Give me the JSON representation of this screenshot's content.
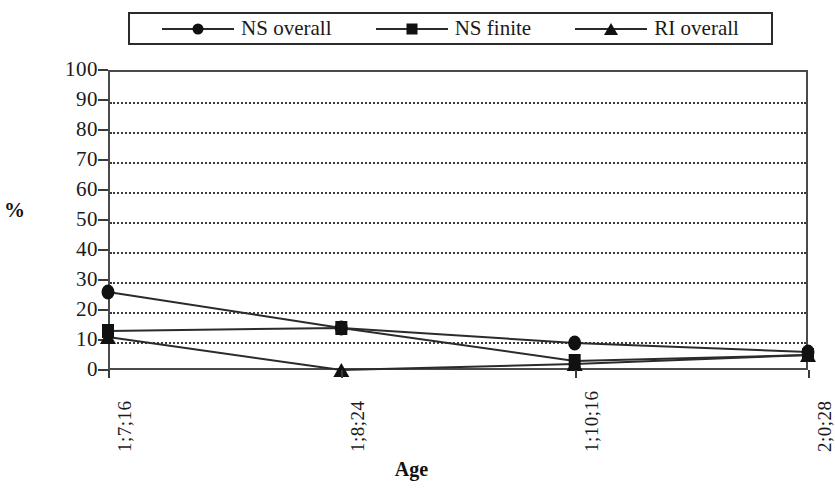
{
  "chart_data": {
    "type": "line",
    "title": "",
    "xlabel": "Age",
    "ylabel": "%",
    "categories": [
      "1;7;16",
      "1;8;24",
      "1;10;16",
      "2;0;28"
    ],
    "series": [
      {
        "name": "NS overall",
        "marker": "circle",
        "values": [
          26,
          14,
          9,
          6
        ]
      },
      {
        "name": "NS finite",
        "marker": "square",
        "values": [
          13,
          14,
          3,
          5
        ]
      },
      {
        "name": "RI overall",
        "marker": "triangle",
        "values": [
          11,
          0,
          2,
          5
        ]
      }
    ],
    "ylim": [
      0,
      100
    ],
    "ytick_labels": [
      "100",
      "90",
      "80",
      "70",
      "60",
      "50",
      "40",
      "30",
      "20",
      "10",
      "0"
    ],
    "ytick_values": [
      100,
      90,
      80,
      70,
      60,
      50,
      40,
      30,
      20,
      10,
      0
    ],
    "grid": "horizontal-dotted",
    "legend_position": "top",
    "line_color": "#2b2b2b",
    "marker_color": "#111111",
    "grid_color": "#3a3a3a",
    "background": "#ffffff"
  },
  "legend": {
    "entries": [
      {
        "label": "NS overall",
        "marker": "circle"
      },
      {
        "label": "NS finite",
        "marker": "square"
      },
      {
        "label": "RI overall",
        "marker": "triangle"
      }
    ]
  },
  "axes": {
    "y_title": "%",
    "x_title": "Age"
  }
}
